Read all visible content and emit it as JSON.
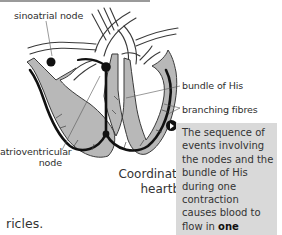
{
  "diagram": {
    "title": "Coordination of a heartbeat",
    "caption_line1": "Coordination of a",
    "caption_line2": "heartbeat",
    "labels": {
      "sinoatrial_node": "sinoatrial node",
      "bundle_of_his": "bundle of His",
      "branching_fibres": "branching fibres",
      "atrioventricular_line1": "atrioventricular",
      "atrioventricular_line2": "node"
    },
    "colors": {
      "tissue_fill": "#b8b8b8",
      "outline": "#3a3a3a",
      "conduction_path": "#111111",
      "callout_bg": "#d9d9d9"
    }
  },
  "callout": {
    "icon": "play-circle-icon",
    "text_before_bold": "The sequence of events involving the nodes and the bundle of His during one contraction causes blood to flow in ",
    "bold_word": "one",
    "text_after_bold": " direction"
  },
  "body_text": {
    "fragment": "ricles."
  }
}
